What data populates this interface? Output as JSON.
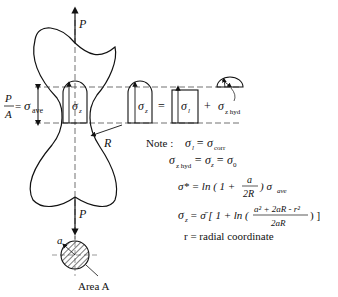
{
  "diagram": {
    "load_label": "P",
    "radius_label": "R",
    "avg_stress": {
      "lhs_num": "P",
      "lhs_den": "A",
      "eq": "=",
      "sigma": "σ",
      "sub": "ave"
    },
    "profile_labels": {
      "sigma_z_1": "σ",
      "sigma_z_sub": "z",
      "equals": "=",
      "sigma_1": "σ",
      "sigma_1_sub": "l",
      "plus": "+",
      "sigma_hyd": "σ",
      "sigma_hyd_sub": "z hyd"
    },
    "note": {
      "label": "Note :",
      "lines": [
        "σl = σcorr",
        "σz hyd = σz = σ0",
        "σ* = ln ( 1 + a / 2R ) σave",
        "σz = σ̄ [ 1 + ln ( (a² + 2aR − r²) / 2aR ) ]",
        "r = radial coordinate"
      ],
      "line1": {
        "sigma": "σ",
        "sub": "l",
        "rhs": "= σ",
        "rhs_sub": "corr"
      },
      "line2": {
        "sigma": "σ",
        "sub": "z hyd",
        "mid": "= σ",
        "mid_sub": "z",
        "rhs": "= σ",
        "rhs_sub": "0"
      },
      "line3": {
        "lhs": "σ* = ln ( 1 +",
        "num": "a",
        "den": "2R",
        "rhs": ") σ",
        "rhs_sub": "ave"
      },
      "line4": {
        "lhs": "σ",
        "lhs_sub": "z",
        "mid": "= σ̄ [ 1 + ln (",
        "num": "a² + 2aR - r²",
        "den": "2aR",
        "rhs": ") ]"
      },
      "line5": "r = radial coordinate"
    },
    "cross_section": {
      "radius_label": "a",
      "area_label": "Area A"
    }
  }
}
